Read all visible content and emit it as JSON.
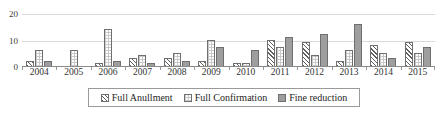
{
  "chart_data": {
    "type": "bar",
    "title": "",
    "subtitle": "",
    "xlabel": "",
    "ylabel": "",
    "ylim": [
      0,
      20
    ],
    "yticks": [
      0,
      10,
      20
    ],
    "grid": true,
    "legend_position": "bottom",
    "categories": [
      "2004",
      "2005",
      "2006",
      "2007",
      "2008",
      "2009",
      "2010",
      "2011",
      "2012",
      "2013",
      "2014",
      "2015"
    ],
    "series": [
      {
        "name": "Full Anullment",
        "pattern": "diagonal-hatch",
        "color": "#5f5f5f",
        "values": [
          2,
          0,
          1,
          3,
          3,
          2,
          1,
          10,
          9,
          2,
          8,
          9
        ]
      },
      {
        "name": "Full Confirmation",
        "pattern": "dotted",
        "color": "#c9c9c9",
        "values": [
          6,
          6,
          14,
          4,
          5,
          10,
          1,
          7,
          4,
          6,
          5,
          5
        ]
      },
      {
        "name": "Fine reduction",
        "pattern": "solid",
        "color": "#9e9e9e",
        "values": [
          2,
          0,
          2,
          1,
          2,
          7,
          6,
          11,
          12,
          16,
          3,
          7
        ]
      }
    ]
  },
  "legend": {
    "items": [
      {
        "label": "Full Anullment"
      },
      {
        "label": "Full Confirmation"
      },
      {
        "label": "Fine reduction"
      }
    ]
  },
  "axes": {
    "y_tick_labels": [
      "0",
      "10",
      "20"
    ]
  }
}
